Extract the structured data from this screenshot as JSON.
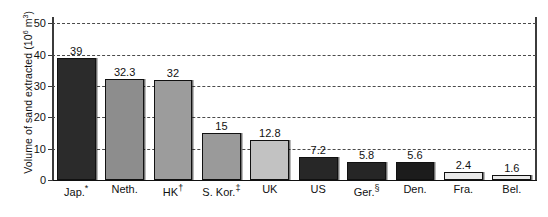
{
  "chart_data": {
    "type": "bar",
    "title": "",
    "xlabel": "",
    "ylabel": "Volume of sand extracted (10⁶ m³)",
    "ylabel_text": "Volume of sand extracted (10",
    "ylabel_exponent": "6",
    "ylabel_tail": " m",
    "ylabel_exponent2": "3",
    "ylabel_close": ")",
    "ylim": [
      0,
      52
    ],
    "yticks": [
      0,
      10,
      20,
      30,
      40,
      50
    ],
    "ytick_labels": [
      "0",
      "10",
      "20",
      "30",
      "40",
      "50"
    ],
    "grid": true,
    "grid_style": "dashed",
    "legend": "none",
    "categories": [
      "Jap.*",
      "Neth.",
      "HK†",
      "S. Kor.‡",
      "UK",
      "US",
      "Ger.§",
      "Den.",
      "Fra.",
      "Bel."
    ],
    "values": [
      39,
      32.3,
      32,
      15,
      12.8,
      7.2,
      5.8,
      5.6,
      2.4,
      1.6
    ],
    "value_labels": [
      "39",
      "32.3",
      "32",
      "15",
      "12.8",
      "7.2",
      "5.8",
      "5.6",
      "2.4",
      "1.6"
    ],
    "bars": [
      {
        "label": "Jap.",
        "footnote": "*",
        "value": 39,
        "value_label": "39",
        "color": "#2b2b2b"
      },
      {
        "label": "Neth.",
        "footnote": "",
        "value": 32.3,
        "value_label": "32.3",
        "color": "#8d8d8d"
      },
      {
        "label": "HK",
        "footnote": "†",
        "value": 32,
        "value_label": "32",
        "color": "#9c9c9c"
      },
      {
        "label": "S. Kor.",
        "footnote": "‡",
        "value": 15,
        "value_label": "15",
        "color": "#9a9a9a"
      },
      {
        "label": "UK",
        "footnote": "",
        "value": 12.8,
        "value_label": "12.8",
        "color": "#c2c2c2"
      },
      {
        "label": "US",
        "footnote": "",
        "value": 7.2,
        "value_label": "7.2",
        "color": "#272727"
      },
      {
        "label": "Ger.",
        "footnote": "§",
        "value": 5.8,
        "value_label": "5.8",
        "color": "#262626"
      },
      {
        "label": "Den.",
        "footnote": "",
        "value": 5.6,
        "value_label": "5.6",
        "color": "#1c1c1c"
      },
      {
        "label": "Fra.",
        "footnote": "",
        "value": 2.4,
        "value_label": "2.4",
        "color": "#e9e9e9"
      },
      {
        "label": "Bel.",
        "footnote": "",
        "value": 1.6,
        "value_label": "1.6",
        "color": "#e9e9e9"
      }
    ]
  }
}
